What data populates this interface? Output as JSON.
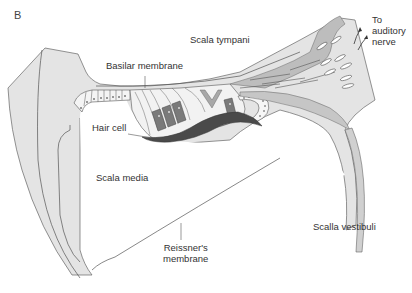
{
  "figure": {
    "panel_label": "B"
  },
  "labels": {
    "scala_tympani": "Scala tympani",
    "basilar_membrane": "Basilar membrane",
    "hair_cell": "Hair cell",
    "scala_media": "Scala media",
    "reissners_line1": "Reissner's",
    "reissners_line2": "membrane",
    "scala_vestibuli": "Scalla vestibuli",
    "auditory_line1": "To",
    "auditory_line2": "auditory",
    "auditory_line3": "nerve"
  },
  "colors": {
    "tissue_light": "#e2e2e2",
    "tissue_mid": "#bdbdbd",
    "tissue_dark": "#6a6a6a",
    "tectorial": "#4a4a4a",
    "outline": "#555555",
    "background": "#ffffff"
  }
}
